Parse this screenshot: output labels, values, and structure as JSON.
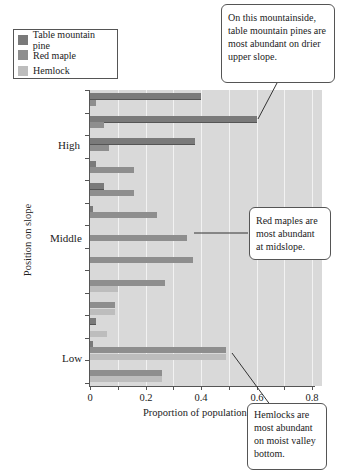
{
  "legend": {
    "items": [
      {
        "label": "Table mountain pine",
        "color": "#7a7a7a"
      },
      {
        "label": "Red maple",
        "color": "#8e8e8e"
      },
      {
        "label": "Hemlock",
        "color": "#bdbdbd"
      }
    ]
  },
  "axes": {
    "x_title": "Proportion of population",
    "y_title": "Position on slope",
    "x_ticks": [
      "0",
      "0.2",
      "0.4",
      "0.6",
      "0.8"
    ],
    "y_categories": [
      "High",
      "Middle",
      "Low"
    ]
  },
  "callouts": {
    "pine": "On this mountainside, table mountain pines are most abundant on drier upper slope.",
    "maple": "Red maples are most abundant at midslope.",
    "hemlock": "Hemlocks are most abundant on moist valley bottom."
  },
  "chart_data": {
    "type": "bar",
    "orientation": "horizontal",
    "title": "",
    "xlabel": "Proportion of population",
    "ylabel": "Position on slope",
    "xlim": [
      0,
      0.8
    ],
    "x_ticks": [
      0,
      0.2,
      0.4,
      0.6,
      0.8
    ],
    "grid": true,
    "legend_position": "top-left",
    "categories_top_to_bottom": [
      "Site 1 (High)",
      "Site 2",
      "Site 3",
      "Site 4",
      "Site 5",
      "Site 6",
      "Site 7 (Middle)",
      "Site 8",
      "Site 9",
      "Site 10",
      "Site 11",
      "Site 12 (Low)",
      "Site 13"
    ],
    "y_region_labels": {
      "High": "Site 2",
      "Middle": "Site 7",
      "Low": "Site 12"
    },
    "series": [
      {
        "name": "Table mountain pine",
        "values": [
          0.4,
          0.6,
          0.38,
          0.02,
          0.05,
          0.01,
          0.0,
          0.0,
          0.0,
          0.0,
          0.02,
          0.01,
          0.0
        ]
      },
      {
        "name": "Red maple",
        "values": [
          0.02,
          0.05,
          0.07,
          0.16,
          0.16,
          0.24,
          0.35,
          0.37,
          0.27,
          0.09,
          0.0,
          0.49,
          0.26
        ]
      },
      {
        "name": "Hemlock",
        "values": [
          0.0,
          0.0,
          0.0,
          0.0,
          0.0,
          0.0,
          0.0,
          0.0,
          0.1,
          0.09,
          0.06,
          0.49,
          0.26
        ]
      }
    ],
    "annotations": [
      "On this mountainside, table mountain pines are most abundant on drier upper slope.",
      "Red maples are most abundant at midslope.",
      "Hemlocks are most abundant on moist valley bottom."
    ]
  }
}
